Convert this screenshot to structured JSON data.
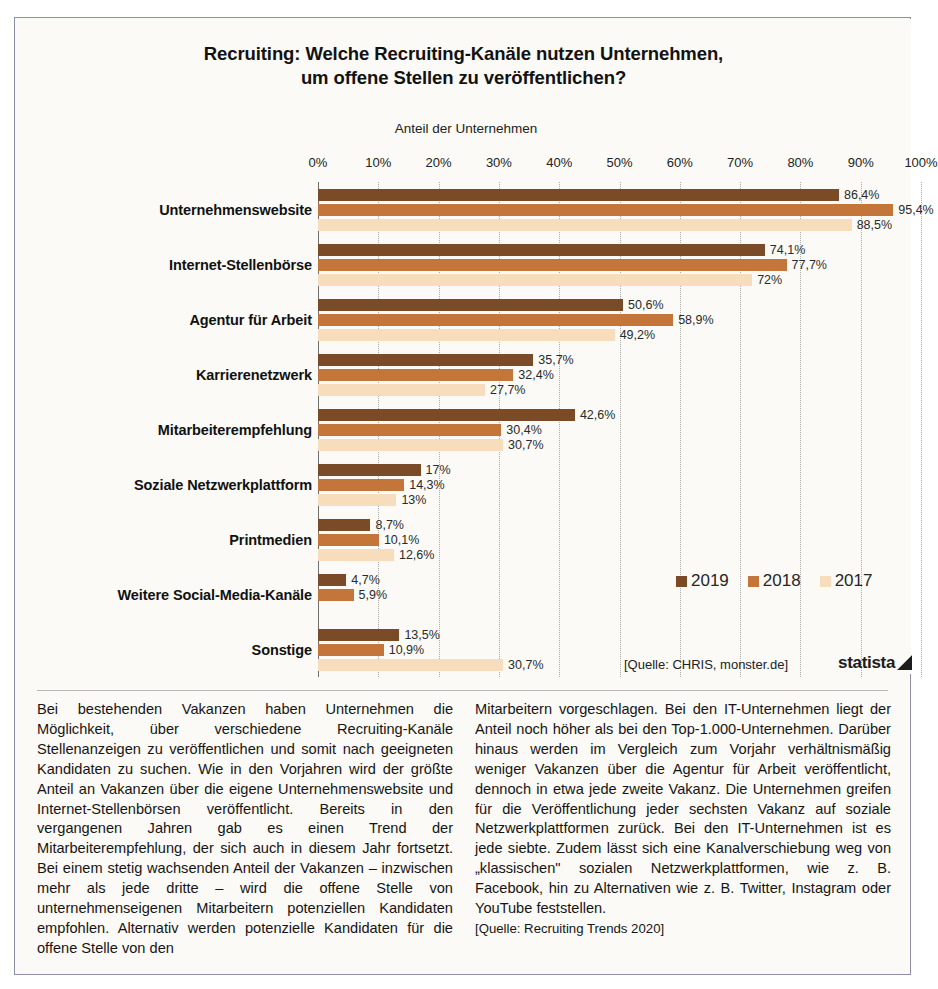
{
  "frame": {
    "legend_label": "Insert"
  },
  "chart": {
    "title_line1": "Recruiting: Welche Recruiting-Kanäle nutzen Unternehmen,",
    "title_line2": "um offene Stellen zu veröffentlichen?",
    "axis_caption": "Anteil der Unternehmen",
    "source_note": "[Quelle: CHRIS, monster.de]",
    "brand": "statista",
    "colors": {
      "series_2019": "#7b4a27",
      "series_2018": "#c4763a",
      "series_2017": "#f7ddbb"
    }
  },
  "chart_data": {
    "type": "bar",
    "orientation": "horizontal",
    "title": "Recruiting: Welche Recruiting-Kanäle nutzen Unternehmen, um offene Stellen zu veröffentlichen?",
    "xlabel": "Anteil der Unternehmen",
    "ylabel": "",
    "xlim": [
      0,
      100
    ],
    "xticks": [
      0,
      10,
      20,
      30,
      40,
      50,
      60,
      70,
      80,
      90,
      100
    ],
    "xtick_labels": [
      "0%",
      "10%",
      "20%",
      "30%",
      "40%",
      "50%",
      "60%",
      "70%",
      "80%",
      "90%",
      "100%"
    ],
    "grid": true,
    "legend_position": "inside-right",
    "categories": [
      "Unternehmenswebsite",
      "Internet-Stellenbörse",
      "Agentur für Arbeit",
      "Karrierenetzwerk",
      "Mitarbeiterempfehlung",
      "Soziale Netzwerkplattform",
      "Printmedien",
      "Weitere Social-Media-Kanäle",
      "Sonstige"
    ],
    "series": [
      {
        "name": "2019",
        "color": "#7b4a27",
        "values": [
          86.4,
          74.1,
          50.6,
          35.7,
          42.6,
          17,
          8.7,
          4.7,
          13.5
        ],
        "labels": [
          "86,4%",
          "74,1%",
          "50,6%",
          "35,7%",
          "42,6%",
          "17%",
          "8,7%",
          "4,7%",
          "13,5%"
        ]
      },
      {
        "name": "2018",
        "color": "#c4763a",
        "values": [
          95.4,
          77.7,
          58.9,
          32.4,
          30.4,
          14.3,
          10.1,
          5.9,
          10.9
        ],
        "labels": [
          "95,4%",
          "77,7%",
          "58,9%",
          "32,4%",
          "30,4%",
          "14,3%",
          "10,1%",
          "5,9%",
          "10,9%"
        ]
      },
      {
        "name": "2017",
        "color": "#f7ddbb",
        "values": [
          88.5,
          72,
          49.2,
          27.7,
          30.7,
          13,
          12.6,
          null,
          30.7
        ],
        "labels": [
          "88,5%",
          "72%",
          "49,2%",
          "27,7%",
          "30,7%",
          "13%",
          "12,6%",
          "",
          "30,7%"
        ]
      }
    ]
  },
  "article": {
    "left_column": "Bei bestehenden Vakanzen haben Unternehmen die Möglichkeit, über verschiedene Recruiting-Kanäle Stellenanzeigen zu veröffentlichen und somit nach geeigneten Kandidaten zu suchen. Wie in den Vorjahren wird der größte Anteil an Vakanzen über die eigene Unternehmenswebsite und Internet-Stellenbörsen veröffentlicht. Bereits in den vergangenen Jahren gab es einen Trend der Mitarbeiterempfehlung, der sich auch in diesem Jahr fortsetzt. Bei einem stetig wachsenden Anteil der Vakanzen – inzwischen mehr als jede dritte – wird die offene Stelle von unternehmenseigenen Mitarbeitern potenziellen Kandidaten empfohlen. Alternativ werden potenzielle Kandidaten für die offene Stelle von den",
    "right_column": "Mitarbeitern vorgeschlagen. Bei den IT-Unternehmen liegt der Anteil noch höher als bei den Top-1.000-Unternehmen. Darüber hinaus werden im Vergleich zum Vorjahr verhältnismäßig weniger Vakanzen über die Agentur für Arbeit veröffentlicht, dennoch in etwa jede zweite Vakanz. Die Unternehmen greifen für die Veröffentlichung jeder sechsten Vakanz auf soziale Netzwerkplattformen zurück. Bei den IT-Unternehmen ist es jede siebte. Zudem lässt sich eine Kanalverschiebung weg von „klassischen\" sozialen Netzwerkplattformen, wie z. B. Facebook, hin zu Alternativen wie z. B. Twitter, Instagram oder YouTube feststellen.",
    "right_source": "[Quelle: Recruiting Trends 2020]"
  }
}
